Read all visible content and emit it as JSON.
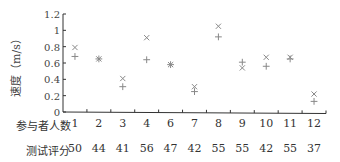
{
  "chart_data": {
    "type": "scatter",
    "title": "",
    "ylabel": "速度（m/s）",
    "xlabel": "参与者人数",
    "ylim": [
      0,
      1.2
    ],
    "yticks": [
      0,
      0.2,
      0.4,
      0.6,
      0.8,
      1,
      1.2
    ],
    "ytick_labels": [
      "0",
      "0.2",
      "0.4",
      "0.6",
      "0.8",
      "1",
      "1.2"
    ],
    "grid": false,
    "legend": null,
    "categories": [
      "1",
      "2",
      "3",
      "4",
      "6",
      "7",
      "8",
      "9",
      "10",
      "11",
      "12"
    ],
    "series": [
      {
        "name": "×",
        "marker": "x",
        "values": [
          0.79,
          0.65,
          0.41,
          0.91,
          0.58,
          0.31,
          1.05,
          0.54,
          0.67,
          0.67,
          0.22
        ]
      },
      {
        "name": "+",
        "marker": "+",
        "values": [
          0.68,
          0.65,
          0.31,
          0.64,
          0.58,
          0.25,
          0.92,
          0.61,
          0.56,
          0.65,
          0.13
        ]
      }
    ],
    "table_rows": [
      {
        "label": "参与者人数",
        "values": [
          "1",
          "2",
          "3",
          "4",
          "6",
          "7",
          "8",
          "9",
          "10",
          "11",
          "12"
        ]
      },
      {
        "label": "测试评分",
        "values": [
          "50",
          "44",
          "41",
          "56",
          "47",
          "42",
          "55",
          "55",
          "42",
          "55",
          "37"
        ]
      }
    ]
  },
  "labels": {
    "ylabel": "速度（m/s）",
    "row1": "参与者人数",
    "row2": "测试评分"
  },
  "colors": {
    "axis": "#333333",
    "marker": "#888888"
  }
}
